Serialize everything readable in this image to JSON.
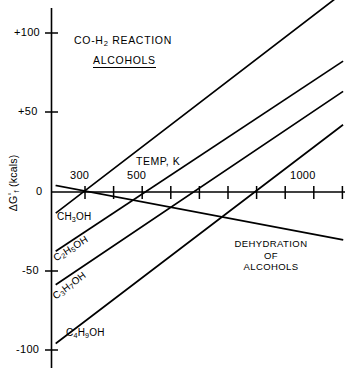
{
  "chart_data": {
    "type": "line",
    "subtitle": "ALCOHOLS",
    "title_display": "CO-H₂ REACTION",
    "xlabel": "TEMP, K",
    "ylabel": "ΔG°f (kcals)",
    "ylabel_display": "ΔG",
    "ylabel_sup": "°",
    "ylabel_sub": "f",
    "ylabel_unit": " (kcals)",
    "xlim": [
      200,
      1200
    ],
    "ylim": [
      -110,
      115
    ],
    "x_tick_values": [
      300,
      400,
      500,
      600,
      700,
      800,
      900,
      1000,
      1100,
      1200
    ],
    "x_tick_labels": [
      "300",
      "",
      "500",
      "",
      "",
      "",
      "",
      "1000",
      "",
      ""
    ],
    "x_labeled_ticks": [
      {
        "value": 300,
        "label": "300"
      },
      {
        "value": 500,
        "label": "500"
      },
      {
        "value": 1000,
        "label": "1000"
      }
    ],
    "y_tick_values": [
      -100,
      -50,
      0,
      50,
      100
    ],
    "y_tick_labels": [
      "-100",
      "-50",
      "0",
      "+50",
      "+100"
    ],
    "grid": false,
    "legend": "inline-curve-labels",
    "series": [
      {
        "name": "CH3OH",
        "label_display": "CH₃OH",
        "points": [
          [
            200,
            -13
          ],
          [
            1200,
            125
          ]
        ]
      },
      {
        "name": "C2H5OH",
        "label_display": "C₂H₅OH",
        "points": [
          [
            200,
            -37
          ],
          [
            1200,
            82
          ]
        ]
      },
      {
        "name": "C3H7OH",
        "label_display": "C₃H₇OH",
        "points": [
          [
            200,
            -58
          ],
          [
            1200,
            63
          ]
        ]
      },
      {
        "name": "C4H9OH",
        "label_display": "C₄H₉OH",
        "points": [
          [
            200,
            -95
          ],
          [
            1200,
            42
          ]
        ]
      },
      {
        "name": "DEHYDRATION OF ALCOHOLS",
        "label_display": "DEHYDRATION OF ALCOHOLS",
        "points": [
          [
            200,
            4
          ],
          [
            1200,
            -30
          ]
        ]
      }
    ],
    "annotations": [
      {
        "name": "dehydration-note",
        "lines": [
          "DEHYDRATION",
          "OF",
          "ALCOHOLS"
        ]
      }
    ],
    "line_color": "#000000",
    "background_color": "#ffffff"
  },
  "labels": {
    "dehydration_line1": "DEHYDRATION",
    "dehydration_line2": "OF",
    "dehydration_line3": "ALCOHOLS"
  }
}
